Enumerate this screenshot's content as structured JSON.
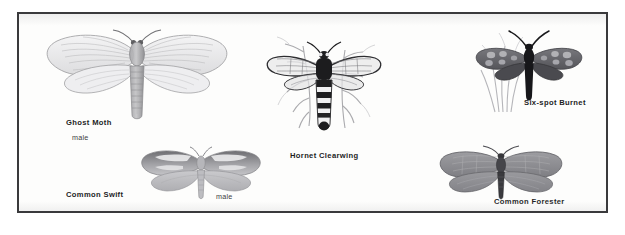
{
  "plate": {
    "background_color": "#fdfdfc",
    "border_color": "#3a3a3c",
    "page_color": "#ffffff"
  },
  "specimens": [
    {
      "id": "ghost-moth",
      "common_name": "Ghost Moth",
      "sex_label": "male",
      "wing_style": "pale translucent veined",
      "body_color": "#8e8e90",
      "wing_color": "#e9e9ea"
    },
    {
      "id": "common-swift",
      "common_name": "Common Swift",
      "sex_label": "male",
      "wing_style": "patterned forewing with white streaks",
      "body_color": "#a9a9ab",
      "wing_color": "#b9b9ba"
    },
    {
      "id": "hornet-clearwing",
      "common_name": "Hornet Clearwing",
      "sex_label": "",
      "wing_style": "clear veined wings, banded abdomen",
      "body_color": "#232325",
      "wing_color": "#cfcfd0"
    },
    {
      "id": "six-spot-burnet",
      "common_name": "Six-spot Burnet",
      "sex_label": "",
      "wing_style": "dark forewings with pale spots on grass",
      "body_color": "#1c1c1e",
      "wing_color": "#6f6f73"
    },
    {
      "id": "common-forester",
      "common_name": "Common Forester",
      "sex_label": "",
      "wing_style": "uniform grey spread wings",
      "body_color": "#3a3a3c",
      "wing_color": "#9a9a9d"
    }
  ]
}
